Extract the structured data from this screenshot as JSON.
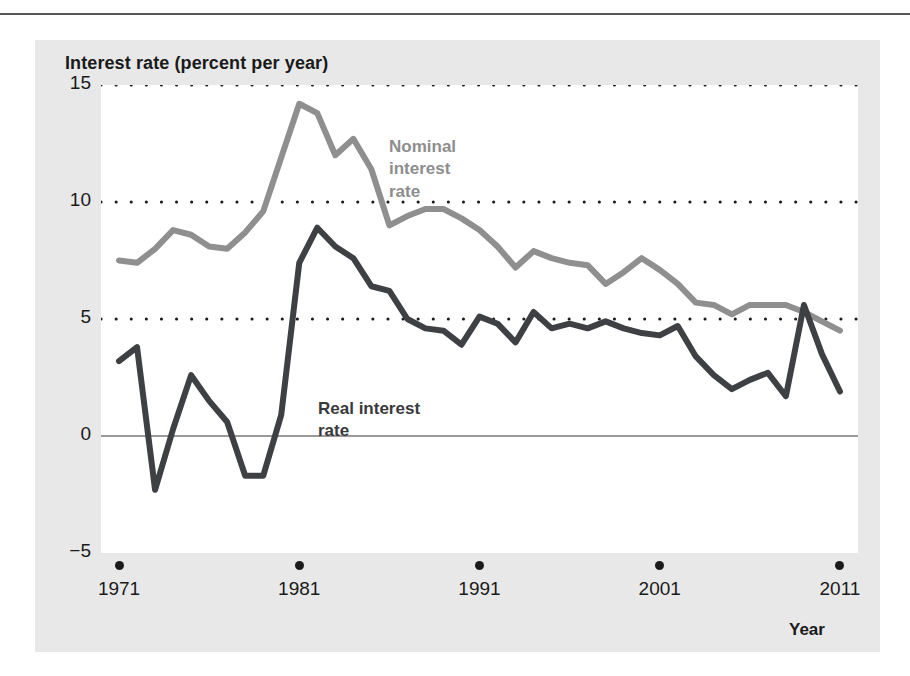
{
  "figure": {
    "title": "Interest rate (percent per year)",
    "colors": {
      "nominal": "#8f8f8f",
      "real": "#3f4043",
      "panel_background": "#e8e8e8",
      "plot_background": "#ffffff",
      "gridline": "#1a1a1a",
      "zero_line": "#9a9a9a",
      "text": "#1a1a1a"
    }
  },
  "labels": {
    "nominal": "Nominal\ninterest\nrate",
    "real": "Real interest\nrate",
    "year_axis": "Year"
  },
  "chart_data": {
    "type": "line",
    "title": "Interest rate (percent per year)",
    "xlabel": "Year",
    "ylabel": "Interest rate (percent per year)",
    "xlim": [
      1970,
      2012
    ],
    "ylim": [
      -5,
      15
    ],
    "grid": true,
    "gridlines": [
      15,
      10,
      5
    ],
    "zero_line": 0,
    "legend_position": "inline-annotations",
    "xticks": [
      "1971",
      "1981",
      "1991",
      "2001",
      "2011"
    ],
    "xtick_values": [
      1971,
      1981,
      1991,
      2001,
      2011
    ],
    "yticks": [
      "15",
      "10",
      "5",
      "0",
      "−5"
    ],
    "ytick_values": [
      15,
      10,
      5,
      0,
      -5
    ],
    "x": [
      1971,
      1972,
      1973,
      1974,
      1975,
      1976,
      1977,
      1978,
      1979,
      1980,
      1981,
      1982,
      1983,
      1984,
      1985,
      1986,
      1987,
      1988,
      1989,
      1990,
      1991,
      1992,
      1993,
      1994,
      1995,
      1996,
      1997,
      1998,
      1999,
      2000,
      2001,
      2002,
      2003,
      2004,
      2005,
      2006,
      2007,
      2008,
      2009,
      2010,
      2011
    ],
    "series": [
      {
        "name": "Nominal interest rate",
        "color": "#8f8f8f",
        "values": [
          7.5,
          7.4,
          8.0,
          8.8,
          8.6,
          8.1,
          8.0,
          8.7,
          9.6,
          11.9,
          14.2,
          13.8,
          12.0,
          12.7,
          11.4,
          9.0,
          9.4,
          9.7,
          9.7,
          9.3,
          8.8,
          8.1,
          7.2,
          7.9,
          7.6,
          7.4,
          7.3,
          6.5,
          7.0,
          7.6,
          7.1,
          6.5,
          5.7,
          5.6,
          5.2,
          5.6,
          5.6,
          5.6,
          5.3,
          4.9,
          4.5
        ]
      },
      {
        "name": "Real interest rate",
        "color": "#3f4043",
        "values": [
          3.2,
          3.8,
          -2.3,
          0.3,
          2.6,
          1.5,
          0.6,
          -1.7,
          -1.7,
          0.9,
          7.4,
          8.9,
          8.1,
          7.6,
          6.4,
          6.2,
          5.0,
          4.6,
          4.5,
          3.9,
          5.1,
          4.8,
          4.0,
          5.3,
          4.6,
          4.8,
          4.6,
          4.9,
          4.6,
          4.4,
          4.3,
          4.7,
          3.4,
          2.6,
          2.0,
          2.4,
          2.7,
          1.7,
          5.6,
          3.5,
          1.9
        ]
      }
    ]
  }
}
